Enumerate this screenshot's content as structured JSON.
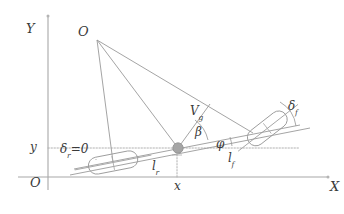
{
  "figure": {
    "type": "vehicle-kinematics-bicycle-model-diagram",
    "background_color": "#ffffff",
    "line_color": "#9a9a9a",
    "axis_color": "#a8a8a8",
    "text_color": "#3a3a3a",
    "marker_color": "#a5a5a5"
  },
  "axes": {
    "x_axis_label": "X",
    "y_axis_label": "Y",
    "origin_label": "O",
    "x_tick_label": "x",
    "y_tick_label": "y"
  },
  "points": {
    "icr_label": "O",
    "cg_marker": "center-of-gravity-dot"
  },
  "vectors": {
    "velocity_symbol": "V",
    "velocity_subscript": "g"
  },
  "angles": {
    "sideslip_symbol": "β",
    "heading_symbol": "φ",
    "front_steer_symbol": "δ",
    "front_steer_subscript": "f",
    "rear_steer_symbol": "δ",
    "rear_steer_subscript": "r",
    "rear_steer_value": "=0"
  },
  "lengths": {
    "rear_symbol": "l",
    "rear_subscript": "r",
    "front_symbol": "l",
    "front_subscript": "f"
  }
}
